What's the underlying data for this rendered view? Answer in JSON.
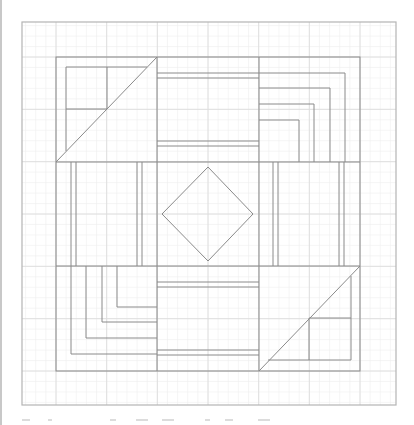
{
  "diagram": {
    "type": "quilt-block-pattern",
    "colors": {
      "background": "#ffffff",
      "grid_minor": "#eeeeee",
      "grid_major": "#dcdcdc",
      "outline": "#8a8a8a",
      "outer_border": "#b4b4b4",
      "left_edge": "#c8c8c8"
    },
    "outer_border": {
      "x": 22,
      "y": 22,
      "w": 374,
      "h": 383
    },
    "inner_square": {
      "x": 56,
      "y": 57,
      "w": 304,
      "h": 314
    },
    "block_columns": [
      56,
      157,
      259,
      360
    ],
    "block_rows": [
      57,
      162,
      266,
      371
    ],
    "blocks": [
      {
        "id": "top-left",
        "kind": "half-square-triangle-with-four-patch",
        "diagonal": [
          [
            56,
            162
          ],
          [
            157,
            57
          ]
        ],
        "inner": {
          "x": 66,
          "y": 67,
          "w": 81,
          "h": 84
        },
        "cross": {
          "x": 107,
          "y": 109
        }
      },
      {
        "id": "top-middle",
        "kind": "rail-horizontal",
        "lines_y": [
          73,
          78,
          141,
          146
        ]
      },
      {
        "id": "top-right",
        "kind": "log-cabin-corner",
        "corners": [
          [
            345,
            73
          ],
          [
            330,
            88
          ],
          [
            314,
            104
          ],
          [
            299,
            120
          ]
        ],
        "origin": "left-bottom"
      },
      {
        "id": "middle-left",
        "kind": "rail-vertical",
        "lines_x": [
          71,
          76,
          137,
          142
        ]
      },
      {
        "id": "center",
        "kind": "diamond",
        "points": [
          [
            208,
            167
          ],
          [
            253,
            214
          ],
          [
            208,
            261
          ],
          [
            162,
            214
          ]
        ]
      },
      {
        "id": "middle-right",
        "kind": "rail-vertical",
        "lines_x": [
          273,
          278,
          339,
          344
        ]
      },
      {
        "id": "bottom-left",
        "kind": "log-cabin-corner",
        "corners": [
          [
            117,
            307
          ],
          [
            102,
            322
          ],
          [
            86,
            338
          ],
          [
            71,
            354
          ]
        ],
        "origin": "top-right"
      },
      {
        "id": "bottom-middle",
        "kind": "rail-horizontal",
        "lines_y": [
          282,
          287,
          350,
          355
        ]
      },
      {
        "id": "bottom-right",
        "kind": "half-square-triangle-with-four-patch",
        "diagonal": [
          [
            259,
            371
          ],
          [
            360,
            266
          ]
        ],
        "inner": {
          "x": 268,
          "y": 276,
          "w": 83,
          "h": 84
        },
        "cross": {
          "x": 309,
          "y": 318
        }
      }
    ]
  },
  "caption": {
    "visible": "clipped",
    "stubs": [
      [
        22,
        8
      ],
      [
        48,
        4
      ],
      [
        110,
        6
      ],
      [
        136,
        12
      ],
      [
        162,
        12
      ],
      [
        205,
        5
      ],
      [
        225,
        8
      ],
      [
        258,
        12
      ]
    ]
  }
}
